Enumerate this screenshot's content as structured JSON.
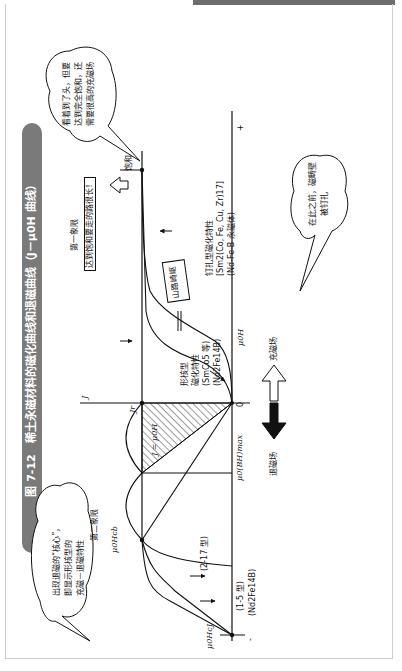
{
  "figure": {
    "title": "图 7-12　稀土永磁材料的磁化曲线和退磁曲线（J－μ0H 曲线）"
  },
  "axes": {
    "origin": "0",
    "x_label": "μ0H",
    "y_label": "J",
    "plus_sign": "+",
    "minus_sign": "-"
  },
  "points": {
    "jr": "Jr",
    "hcb": "μ0Hcb",
    "hcj": "μ0HcJ",
    "bhmax": "μ0(BH)max",
    "saturation": "饱和",
    "j_eq": "J = μ0H"
  },
  "quadrants": {
    "first": "第一象限",
    "first_note": "达到饱和要走的路很长！",
    "second": "第二象限"
  },
  "curves": {
    "nucleation_type": "形核型",
    "nucleation_type_2": "磁化特性",
    "nucleation_examples": "(SmCo5 等)",
    "nucleation_examples_2": "(Nd2Fe14B)",
    "pinning_type": "钉扎型磁化特性",
    "pinning_examples": "[Sm2(Co, Fe, Cu, Zr)17]",
    "pinning_examples_2": "(Nd-Fe-B 永磁体)",
    "type_1_5": "(1-5 型)",
    "type_1_5_formula": "(Nd2Fe14B)",
    "type_2_17": "(2-17 型)"
  },
  "signs": {
    "mountain_pass": "山路崎岖"
  },
  "arrows": {
    "magnetize": "充磁场",
    "demagnetize": "退磁场"
  },
  "bubbles": {
    "saturation_note": [
      "看着到了头，但要",
      "达到完全饱和，还",
      "需要很高的充磁场"
    ],
    "pinning_note": [
      "在此之前，磁畴壁",
      "被钉扎"
    ],
    "nucleation_note": [
      "出现退磁的“核心”，",
      "即显示形核型的",
      "充磁－退磁特性"
    ]
  }
}
